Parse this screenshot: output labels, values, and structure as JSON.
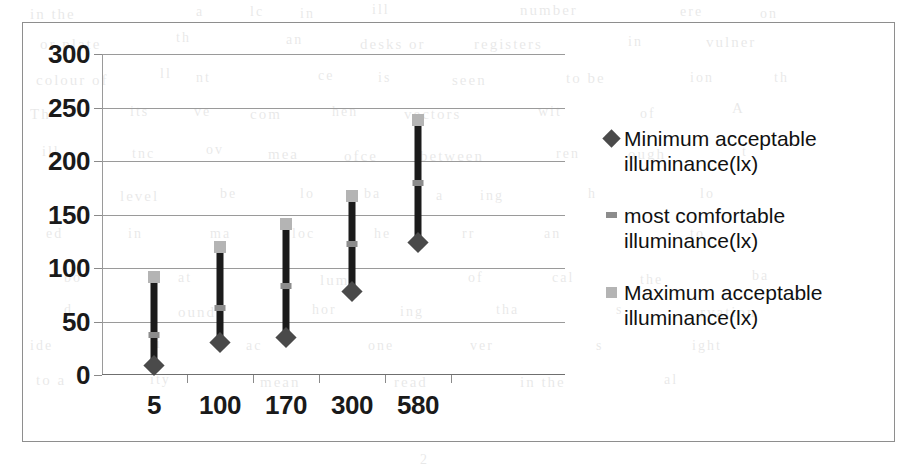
{
  "chart_data": {
    "type": "bar",
    "subtype": "high-low-close range (stock) chart",
    "title": "",
    "xlabel": "",
    "ylabel": "",
    "categories": [
      "5",
      "100",
      "170",
      "300",
      "580"
    ],
    "ylim": [
      0,
      300
    ],
    "ytick_values": [
      0,
      50,
      100,
      150,
      200,
      250,
      300
    ],
    "ytick_labels": [
      "0",
      "50",
      "100",
      "150",
      "200",
      "250",
      "300"
    ],
    "grid": true,
    "grid_axis": "y",
    "legend_position": "right",
    "series": [
      {
        "name": "Minimum acceptable illuminance(lx)",
        "marker": "diamond",
        "color": "#4a4a4a",
        "values": [
          8,
          30,
          35,
          78,
          123
        ]
      },
      {
        "name": "most comfortable illuminance(lx)",
        "marker": "dash",
        "color": "#8c8c8c",
        "values": [
          37,
          63,
          83,
          122,
          179
        ]
      },
      {
        "name": "Maximum acceptable illuminance(lx)",
        "marker": "square",
        "color": "#b4b4b4",
        "values": [
          92,
          120,
          141,
          167,
          238
        ]
      }
    ]
  },
  "legend": {
    "entries": [
      {
        "label": "Minimum acceptable illuminance(lx)",
        "key": "diamond-marker-icon"
      },
      {
        "label": "most comfortable illuminance(lx)",
        "key": "dash-marker-icon"
      },
      {
        "label": "Maximum acceptable illuminance(lx)",
        "key": "square-marker-icon"
      }
    ]
  },
  "ghost_text": [
    {
      "text": "in the",
      "x": 30,
      "y": 6,
      "size": 15
    },
    {
      "text": "a",
      "x": 196,
      "y": 4,
      "size": 14
    },
    {
      "text": "lc",
      "x": 250,
      "y": 4,
      "size": 14
    },
    {
      "text": "in",
      "x": 300,
      "y": 6,
      "size": 14
    },
    {
      "text": "ill",
      "x": 372,
      "y": 2,
      "size": 14
    },
    {
      "text": "number",
      "x": 520,
      "y": 2,
      "size": 15
    },
    {
      "text": "ere",
      "x": 680,
      "y": 4,
      "size": 14
    },
    {
      "text": "on",
      "x": 760,
      "y": 6,
      "size": 14
    },
    {
      "text": "or plate",
      "x": 40,
      "y": 36,
      "size": 15
    },
    {
      "text": "th",
      "x": 176,
      "y": 30,
      "size": 14
    },
    {
      "text": "an",
      "x": 286,
      "y": 32,
      "size": 14
    },
    {
      "text": "desks or",
      "x": 360,
      "y": 36,
      "size": 15
    },
    {
      "text": "registers",
      "x": 474,
      "y": 36,
      "size": 15
    },
    {
      "text": "in",
      "x": 628,
      "y": 34,
      "size": 14
    },
    {
      "text": "vulner",
      "x": 706,
      "y": 34,
      "size": 15
    },
    {
      "text": "colour of",
      "x": 36,
      "y": 72,
      "size": 15
    },
    {
      "text": "ll",
      "x": 160,
      "y": 66,
      "size": 14
    },
    {
      "text": "nt",
      "x": 196,
      "y": 70,
      "size": 14
    },
    {
      "text": "ce",
      "x": 318,
      "y": 68,
      "size": 14
    },
    {
      "text": "is",
      "x": 378,
      "y": 70,
      "size": 14
    },
    {
      "text": "seen",
      "x": 452,
      "y": 72,
      "size": 15
    },
    {
      "text": "to be",
      "x": 566,
      "y": 70,
      "size": 15
    },
    {
      "text": "ion",
      "x": 690,
      "y": 70,
      "size": 14
    },
    {
      "text": "th",
      "x": 774,
      "y": 70,
      "size": 14
    },
    {
      "text": "Th",
      "x": 30,
      "y": 106,
      "size": 15
    },
    {
      "text": "its",
      "x": 130,
      "y": 104,
      "size": 14
    },
    {
      "text": "ve",
      "x": 194,
      "y": 104,
      "size": 14
    },
    {
      "text": "com",
      "x": 250,
      "y": 106,
      "size": 15
    },
    {
      "text": "hen",
      "x": 332,
      "y": 104,
      "size": 14
    },
    {
      "text": "vectors",
      "x": 404,
      "y": 106,
      "size": 15
    },
    {
      "text": "wit",
      "x": 538,
      "y": 104,
      "size": 14
    },
    {
      "text": "of",
      "x": 640,
      "y": 106,
      "size": 14
    },
    {
      "text": "A",
      "x": 732,
      "y": 100,
      "size": 15
    },
    {
      "text": "ill",
      "x": 42,
      "y": 144,
      "size": 14
    },
    {
      "text": "tnc",
      "x": 132,
      "y": 146,
      "size": 14
    },
    {
      "text": "ov",
      "x": 206,
      "y": 142,
      "size": 14
    },
    {
      "text": "mea",
      "x": 268,
      "y": 146,
      "size": 15
    },
    {
      "text": "ofce",
      "x": 344,
      "y": 148,
      "size": 15
    },
    {
      "text": "between",
      "x": 420,
      "y": 148,
      "size": 15
    },
    {
      "text": "ren",
      "x": 556,
      "y": 146,
      "size": 14
    },
    {
      "text": "ough",
      "x": 628,
      "y": 146,
      "size": 15
    },
    {
      "text": "t",
      "x": 742,
      "y": 144,
      "size": 14
    },
    {
      "text": "level",
      "x": 120,
      "y": 188,
      "size": 15
    },
    {
      "text": "be",
      "x": 220,
      "y": 186,
      "size": 14
    },
    {
      "text": "lo",
      "x": 300,
      "y": 186,
      "size": 14
    },
    {
      "text": "ba",
      "x": 364,
      "y": 186,
      "size": 14
    },
    {
      "text": "a",
      "x": 436,
      "y": 188,
      "size": 14
    },
    {
      "text": "ing",
      "x": 480,
      "y": 188,
      "size": 14
    },
    {
      "text": "h",
      "x": 588,
      "y": 186,
      "size": 14
    },
    {
      "text": "lo",
      "x": 700,
      "y": 186,
      "size": 14
    },
    {
      "text": "ed",
      "x": 46,
      "y": 226,
      "size": 14
    },
    {
      "text": "in",
      "x": 128,
      "y": 226,
      "size": 14
    },
    {
      "text": "ma",
      "x": 210,
      "y": 226,
      "size": 14
    },
    {
      "text": "loc",
      "x": 292,
      "y": 226,
      "size": 14
    },
    {
      "text": "he",
      "x": 374,
      "y": 226,
      "size": 14
    },
    {
      "text": "rr",
      "x": 462,
      "y": 226,
      "size": 14
    },
    {
      "text": "an",
      "x": 544,
      "y": 226,
      "size": 14
    },
    {
      "text": "to",
      "x": 690,
      "y": 226,
      "size": 14
    },
    {
      "text": "bo",
      "x": 64,
      "y": 270,
      "size": 14
    },
    {
      "text": "at",
      "x": 178,
      "y": 270,
      "size": 14
    },
    {
      "text": "lumi",
      "x": 320,
      "y": 272,
      "size": 15
    },
    {
      "text": "of",
      "x": 468,
      "y": 270,
      "size": 14
    },
    {
      "text": "cal",
      "x": 552,
      "y": 270,
      "size": 14
    },
    {
      "text": "the",
      "x": 640,
      "y": 272,
      "size": 14
    },
    {
      "text": "ba",
      "x": 752,
      "y": 268,
      "size": 14
    },
    {
      "text": "d",
      "x": 64,
      "y": 302,
      "size": 14
    },
    {
      "text": "ound",
      "x": 178,
      "y": 304,
      "size": 15
    },
    {
      "text": "hor",
      "x": 312,
      "y": 302,
      "size": 14
    },
    {
      "text": "ing",
      "x": 400,
      "y": 304,
      "size": 14
    },
    {
      "text": "tha",
      "x": 496,
      "y": 302,
      "size": 14
    },
    {
      "text": "s",
      "x": 616,
      "y": 302,
      "size": 14
    },
    {
      "text": "rvation",
      "x": 700,
      "y": 304,
      "size": 15
    },
    {
      "text": "ide",
      "x": 30,
      "y": 338,
      "size": 14
    },
    {
      "text": "ti",
      "x": 150,
      "y": 336,
      "size": 14
    },
    {
      "text": "ac",
      "x": 246,
      "y": 338,
      "size": 14
    },
    {
      "text": "one",
      "x": 368,
      "y": 338,
      "size": 14
    },
    {
      "text": "ver",
      "x": 470,
      "y": 338,
      "size": 14
    },
    {
      "text": "s",
      "x": 596,
      "y": 338,
      "size": 14
    },
    {
      "text": "ight",
      "x": 692,
      "y": 338,
      "size": 14
    },
    {
      "text": "to a",
      "x": 36,
      "y": 372,
      "size": 15
    },
    {
      "text": "ity",
      "x": 150,
      "y": 372,
      "size": 14
    },
    {
      "text": "mean",
      "x": 260,
      "y": 374,
      "size": 15
    },
    {
      "text": "read",
      "x": 394,
      "y": 374,
      "size": 15
    },
    {
      "text": "in the",
      "x": 520,
      "y": 374,
      "size": 15
    },
    {
      "text": "al",
      "x": 664,
      "y": 372,
      "size": 14
    },
    {
      "text": "2",
      "x": 420,
      "y": 452,
      "size": 14
    }
  ]
}
